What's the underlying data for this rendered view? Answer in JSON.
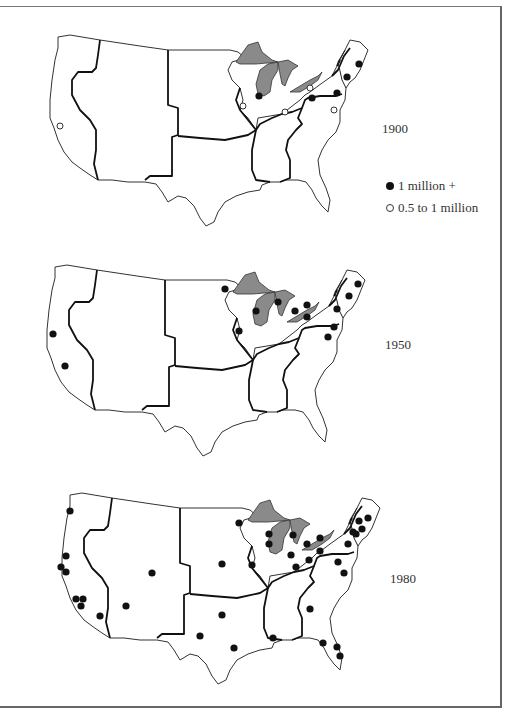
{
  "figure": {
    "panels": [
      {
        "year": "1900",
        "offset": [
          0,
          0
        ],
        "label_pos": [
          382,
          128
        ],
        "cities": [
          {
            "x": 259,
            "y": 96,
            "type": "filled"
          },
          {
            "x": 359,
            "y": 64,
            "type": "filled"
          },
          {
            "x": 347,
            "y": 77,
            "type": "filled"
          },
          {
            "x": 337,
            "y": 93,
            "type": "filled"
          },
          {
            "x": 312,
            "y": 98,
            "type": "filled"
          },
          {
            "x": 310,
            "y": 88,
            "type": "open"
          },
          {
            "x": 334,
            "y": 110,
            "type": "open"
          },
          {
            "x": 285,
            "y": 112,
            "type": "open"
          },
          {
            "x": 243,
            "y": 106,
            "type": "open"
          },
          {
            "x": 60,
            "y": 126,
            "type": "open"
          }
        ]
      },
      {
        "year": "1950",
        "offset": [
          -3,
          230
        ],
        "label_pos": [
          385,
          344
        ],
        "cities": [
          {
            "x": 225,
            "y": 289,
            "type": "filled"
          },
          {
            "x": 239,
            "y": 331,
            "type": "filled"
          },
          {
            "x": 256,
            "y": 311,
            "type": "filled"
          },
          {
            "x": 278,
            "y": 302,
            "type": "filled"
          },
          {
            "x": 295,
            "y": 311,
            "type": "filled"
          },
          {
            "x": 307,
            "y": 305,
            "type": "filled"
          },
          {
            "x": 307,
            "y": 317,
            "type": "filled"
          },
          {
            "x": 337,
            "y": 309,
            "type": "filled"
          },
          {
            "x": 349,
            "y": 296,
            "type": "filled"
          },
          {
            "x": 358,
            "y": 284,
            "type": "filled"
          },
          {
            "x": 334,
            "y": 327,
            "type": "filled"
          },
          {
            "x": 328,
            "y": 337,
            "type": "filled"
          },
          {
            "x": 53,
            "y": 334,
            "type": "filled"
          },
          {
            "x": 65,
            "y": 366,
            "type": "filled"
          }
        ]
      },
      {
        "year": "1980",
        "offset": [
          12,
          458
        ],
        "label_pos": [
          390,
          578
        ],
        "cities": [
          {
            "x": 70,
            "y": 511,
            "type": "filled"
          },
          {
            "x": 66,
            "y": 556,
            "type": "filled"
          },
          {
            "x": 61,
            "y": 567,
            "type": "filled"
          },
          {
            "x": 66,
            "y": 572,
            "type": "filled"
          },
          {
            "x": 76,
            "y": 599,
            "type": "filled"
          },
          {
            "x": 83,
            "y": 599,
            "type": "filled"
          },
          {
            "x": 81,
            "y": 606,
            "type": "filled"
          },
          {
            "x": 100,
            "y": 616,
            "type": "filled"
          },
          {
            "x": 152,
            "y": 573,
            "type": "filled"
          },
          {
            "x": 126,
            "y": 606,
            "type": "filled"
          },
          {
            "x": 222,
            "y": 564,
            "type": "filled"
          },
          {
            "x": 222,
            "y": 615,
            "type": "filled"
          },
          {
            "x": 200,
            "y": 636,
            "type": "filled"
          },
          {
            "x": 234,
            "y": 648,
            "type": "filled"
          },
          {
            "x": 273,
            "y": 638,
            "type": "filled"
          },
          {
            "x": 239,
            "y": 523,
            "type": "filled"
          },
          {
            "x": 269,
            "y": 534,
            "type": "filled"
          },
          {
            "x": 269,
            "y": 544,
            "type": "filled"
          },
          {
            "x": 293,
            "y": 535,
            "type": "filled"
          },
          {
            "x": 252,
            "y": 565,
            "type": "filled"
          },
          {
            "x": 291,
            "y": 555,
            "type": "filled"
          },
          {
            "x": 296,
            "y": 567,
            "type": "filled"
          },
          {
            "x": 307,
            "y": 544,
            "type": "filled"
          },
          {
            "x": 309,
            "y": 560,
            "type": "filled"
          },
          {
            "x": 320,
            "y": 538,
            "type": "filled"
          },
          {
            "x": 320,
            "y": 551,
            "type": "filled"
          },
          {
            "x": 310,
            "y": 609,
            "type": "filled"
          },
          {
            "x": 338,
            "y": 562,
            "type": "filled"
          },
          {
            "x": 344,
            "y": 573,
            "type": "filled"
          },
          {
            "x": 348,
            "y": 544,
            "type": "filled"
          },
          {
            "x": 353,
            "y": 532,
            "type": "filled"
          },
          {
            "x": 359,
            "y": 521,
            "type": "filled"
          },
          {
            "x": 362,
            "y": 529,
            "type": "filled"
          },
          {
            "x": 356,
            "y": 534,
            "type": "filled"
          },
          {
            "x": 368,
            "y": 518,
            "type": "filled"
          },
          {
            "x": 323,
            "y": 643,
            "type": "filled"
          },
          {
            "x": 337,
            "y": 647,
            "type": "filled"
          },
          {
            "x": 340,
            "y": 656,
            "type": "filled"
          }
        ]
      }
    ]
  },
  "legend": {
    "filled_label": "1 million +",
    "open_label": "0.5 to 1 million"
  },
  "colors": {
    "lakes": "#8a8a8a",
    "city_filled": "#111111",
    "outline": "#333333"
  }
}
